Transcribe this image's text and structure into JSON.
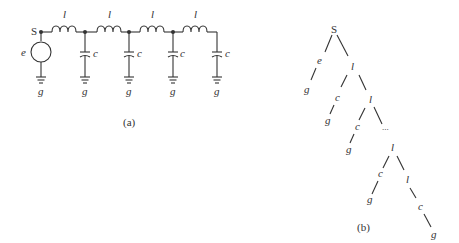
{
  "figure_a": {
    "caption": "(a)",
    "source_node_label": "S",
    "source_label": "e",
    "inductor_label": "l",
    "capacitor_label": "c",
    "ground_label": "g",
    "inductor_count": 4,
    "capacitor_count": 4
  },
  "figure_b": {
    "caption": "(b)",
    "root": "S",
    "nodes": {
      "e": "e",
      "g1": "g",
      "l1": "l",
      "c1": "c",
      "g2": "g",
      "l2": "l",
      "c2": "c",
      "g3": "g",
      "ellipsis": "...",
      "l3": "l",
      "c3": "c",
      "g4": "g",
      "l4": "l",
      "c4": "c",
      "g5": "g"
    }
  }
}
